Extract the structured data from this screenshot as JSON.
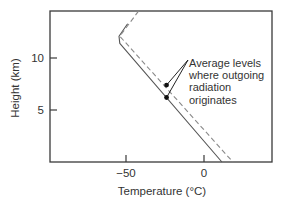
{
  "chart_data": {
    "type": "line",
    "title": "",
    "xlabel": "Temperature (°C)",
    "ylabel": "Height (km)",
    "xlim": [
      -99,
      44
    ],
    "ylim": [
      0,
      14.5
    ],
    "grid": false,
    "legend": null,
    "x_ticks": [
      {
        "value": -50,
        "label": "−50"
      },
      {
        "value": 0,
        "label": "0"
      }
    ],
    "y_ticks": [
      {
        "value": 5,
        "label": "5"
      },
      {
        "value": 10,
        "label": "10"
      }
    ],
    "series": [
      {
        "name": "solid-profile",
        "style": "solid",
        "color": "#555555",
        "points": [
          [
            -49,
            13.3
          ],
          [
            -54.5,
            12.1
          ],
          [
            -54,
            11.4
          ],
          [
            11.5,
            0
          ]
        ]
      },
      {
        "name": "dashed-profile",
        "style": "dashed",
        "color": "#888888",
        "points": [
          [
            -42,
            14.5
          ],
          [
            -54,
            12.1
          ],
          [
            18.5,
            0
          ]
        ]
      }
    ],
    "markers": [
      {
        "series": "dashed-profile",
        "x": -24,
        "y": 7.4
      },
      {
        "series": "solid-profile",
        "x": -24,
        "y": 6.2
      }
    ],
    "annotations": [
      {
        "text_lines": [
          "Average levels",
          "where outgoing",
          "radiation",
          "originates"
        ],
        "points_to": [
          "markers.0",
          "markers.1"
        ]
      }
    ]
  },
  "layout": {
    "plot": {
      "left": 50,
      "top": 11,
      "right": 272,
      "bottom": 162
    },
    "x_map": {
      "origin_px": 204,
      "px_per_unit": 1.56
    },
    "y_map": {
      "origin_px": 162,
      "px_per_unit": 10.4
    }
  },
  "colors": {
    "axis": "#3a3a3a",
    "text": "#333333",
    "solid_line": "#555555",
    "dashed_line": "#8a8a8a",
    "marker": "#111111"
  }
}
